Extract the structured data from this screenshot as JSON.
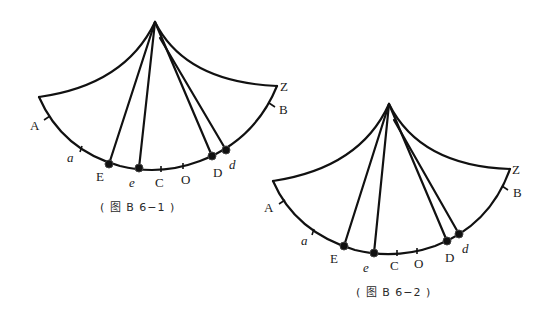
{
  "figures": [
    {
      "id": "fig1",
      "caption": "( 图 B 6−1 )",
      "labels": {
        "A": "A",
        "a": "a",
        "E": "E",
        "e": "e",
        "C": "C",
        "O": "O",
        "D": "D",
        "d": "d",
        "B": "B",
        "Z": "Z"
      }
    },
    {
      "id": "fig2",
      "caption": "( 图 B 6−2 )",
      "labels": {
        "A": "A",
        "a": "a",
        "E": "E",
        "e": "e",
        "C": "C",
        "O": "O",
        "D": "D",
        "d": "d",
        "B": "B",
        "Z": "Z"
      }
    }
  ],
  "colors": {
    "line": "#111111",
    "background": "#ffffff"
  }
}
